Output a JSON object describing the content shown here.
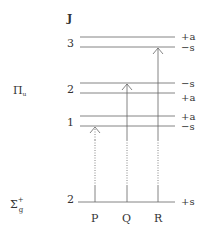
{
  "title_axis_label": "J",
  "states": {
    "upper": {
      "label": "Π",
      "subscript": "u"
    },
    "lower": {
      "label": "Σ",
      "subscript": "g",
      "superscript": "+"
    }
  },
  "levels": [
    {
      "J": "3",
      "sublevels": [
        {
          "parity": "+a"
        },
        {
          "parity": "−s"
        }
      ],
      "state": "upper"
    },
    {
      "J": "2",
      "sublevels": [
        {
          "parity": "−s"
        },
        {
          "parity": "+a"
        }
      ],
      "state": "upper"
    },
    {
      "J": "1",
      "sublevels": [
        {
          "parity": "+a"
        },
        {
          "parity": "−s"
        }
      ],
      "state": "upper"
    },
    {
      "J": "2",
      "sublevels": [
        {
          "parity": "+s"
        }
      ],
      "state": "lower"
    }
  ],
  "branches": [
    {
      "label": "P",
      "to": "J=1 −s"
    },
    {
      "label": "Q",
      "to": "J=2 −s"
    },
    {
      "label": "R",
      "to": "J=3 −s"
    }
  ],
  "colors": {
    "line": "#555555",
    "text": "#333333"
  }
}
